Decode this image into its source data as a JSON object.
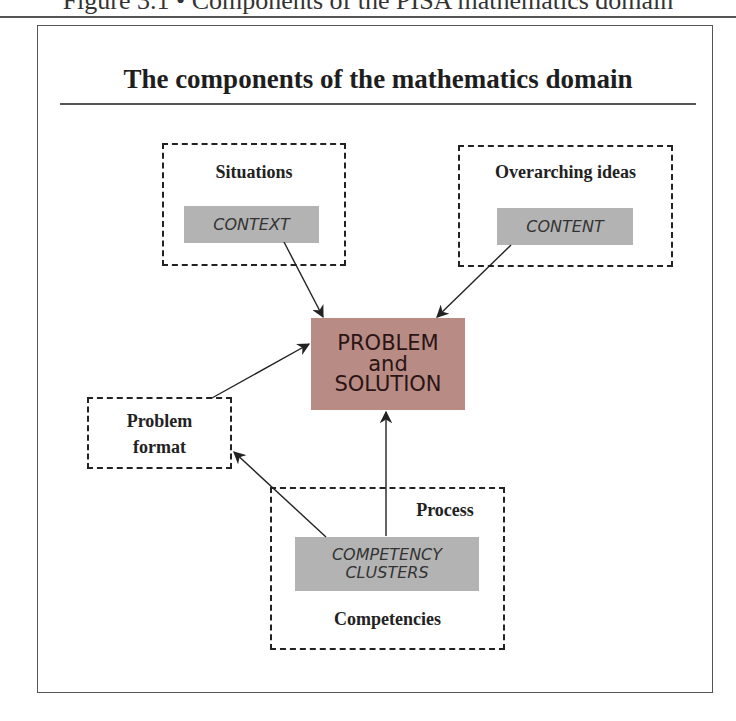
{
  "caption": {
    "text": "Figure 3.1 • Components of the PISA mathematics domain"
  },
  "title": "The components of the mathematics domain",
  "nodes": {
    "situations": {
      "label": "Situations",
      "inner": "CONTEXT"
    },
    "overarching": {
      "label": "Overarching ideas",
      "inner": "CONTENT"
    },
    "problem": {
      "line1": "PROBLEM",
      "line2": "and",
      "line3": "SOLUTION"
    },
    "format": {
      "line1": "Problem",
      "line2": "format"
    },
    "process": {
      "label_top": "Process",
      "inner_line1": "COMPETENCY",
      "inner_line2": "CLUSTERS",
      "label_bottom": "Competencies"
    }
  },
  "edges": [
    {
      "from": "CONTEXT",
      "to": "PROBLEM and SOLUTION"
    },
    {
      "from": "CONTENT",
      "to": "PROBLEM and SOLUTION"
    },
    {
      "from": "Problem format",
      "to": "PROBLEM and SOLUTION"
    },
    {
      "from": "COMPETENCY CLUSTERS",
      "to": "PROBLEM and SOLUTION"
    },
    {
      "from": "COMPETENCY CLUSTERS",
      "to": "Problem format"
    }
  ],
  "colors": {
    "problem_fill": "#b98b85",
    "inner_fill": "#b3b3b3",
    "line": "#222222"
  }
}
